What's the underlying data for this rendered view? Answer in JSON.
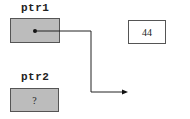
{
  "diagram": {
    "pointers": [
      {
        "name": "ptr1",
        "content": "",
        "points_to": "value"
      },
      {
        "name": "ptr2",
        "content": "?"
      }
    ],
    "value": {
      "content": "44"
    },
    "colors": {
      "pointer_fill": "#bcbcbc",
      "border": "#555555",
      "line": "#222222"
    }
  }
}
